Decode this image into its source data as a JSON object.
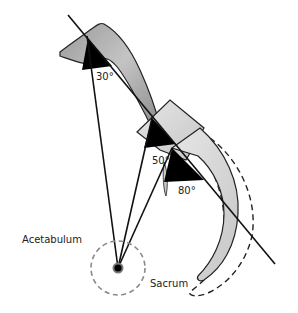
{
  "diagram": {
    "labels": {
      "acetabulum": "Acetabulum",
      "sacrum": "Sacrum"
    },
    "angles": {
      "a1": "30°",
      "a2": "50°",
      "a3": "80°"
    },
    "colors": {
      "stroke": "#111111",
      "bone_fill": "#b8b8b8",
      "bone_fill_light": "#d6d6d6",
      "wedge": "#000000",
      "dashed_circle": "#8a8a8a"
    }
  }
}
